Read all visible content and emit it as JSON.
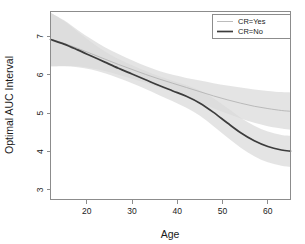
{
  "chart_data": {
    "type": "line",
    "title": "",
    "xlabel": "Age",
    "ylabel": "Optimal AUC Interval",
    "xlim": [
      12,
      65
    ],
    "ylim": [
      2.75,
      7.65
    ],
    "xticks": [
      20,
      30,
      40,
      50,
      60
    ],
    "yticks": [
      3,
      4,
      5,
      6,
      7
    ],
    "xtick_labels": [
      "20",
      "30",
      "40",
      "50",
      "60"
    ],
    "ytick_labels": [
      "3",
      "4",
      "5",
      "6",
      "7"
    ],
    "grid": false,
    "legend_position": "top-right",
    "series": [
      {
        "name": "CR=Yes",
        "color": "#b4b4b4",
        "line_width": 0.9,
        "x": [
          12,
          15,
          18,
          21,
          24,
          27,
          30,
          33,
          36,
          39,
          42,
          45,
          48,
          51,
          54,
          57,
          60,
          63,
          65
        ],
        "values": [
          6.93,
          6.82,
          6.69,
          6.55,
          6.41,
          6.27,
          6.14,
          6.01,
          5.89,
          5.78,
          5.67,
          5.56,
          5.45,
          5.35,
          5.26,
          5.18,
          5.12,
          5.07,
          5.05
        ],
        "band_lower": [
          6.22,
          6.23,
          6.22,
          6.17,
          6.1,
          6.0,
          5.9,
          5.79,
          5.67,
          5.55,
          5.42,
          5.28,
          5.13,
          4.99,
          4.86,
          4.75,
          4.66,
          4.6,
          4.57
        ],
        "band_upper": [
          7.62,
          7.42,
          7.17,
          6.93,
          6.72,
          6.54,
          6.38,
          6.23,
          6.1,
          6.0,
          5.92,
          5.85,
          5.78,
          5.72,
          5.67,
          5.62,
          5.58,
          5.55,
          5.54
        ]
      },
      {
        "name": "CR=No",
        "color": "#3c3c3c",
        "line_width": 1.7,
        "x": [
          12,
          15,
          18,
          21,
          24,
          27,
          30,
          33,
          36,
          39,
          42,
          45,
          48,
          51,
          54,
          57,
          60,
          63,
          65
        ],
        "values": [
          6.92,
          6.8,
          6.65,
          6.49,
          6.33,
          6.17,
          6.02,
          5.87,
          5.72,
          5.58,
          5.44,
          5.26,
          5.02,
          4.75,
          4.49,
          4.28,
          4.13,
          4.04,
          4.01
        ],
        "band_lower": [
          6.22,
          6.22,
          6.2,
          6.14,
          6.04,
          5.92,
          5.78,
          5.63,
          5.47,
          5.31,
          5.14,
          4.93,
          4.66,
          4.37,
          4.1,
          3.88,
          3.72,
          3.63,
          3.6
        ],
        "band_upper": [
          7.62,
          7.4,
          7.12,
          6.85,
          6.61,
          6.41,
          6.25,
          6.1,
          5.96,
          5.84,
          5.73,
          5.59,
          5.39,
          5.14,
          4.88,
          4.67,
          4.52,
          4.43,
          4.41
        ]
      }
    ],
    "band_color": "#d9d9d9",
    "band_opacity": 0.72,
    "axis_color": "#8c8c8c",
    "background": "#ffffff"
  },
  "legend": {
    "entries": [
      {
        "label": "CR=Yes"
      },
      {
        "label": "CR=No"
      }
    ]
  },
  "axes": {
    "x_title": "Age",
    "y_title": "Optimal AUC Interval"
  }
}
